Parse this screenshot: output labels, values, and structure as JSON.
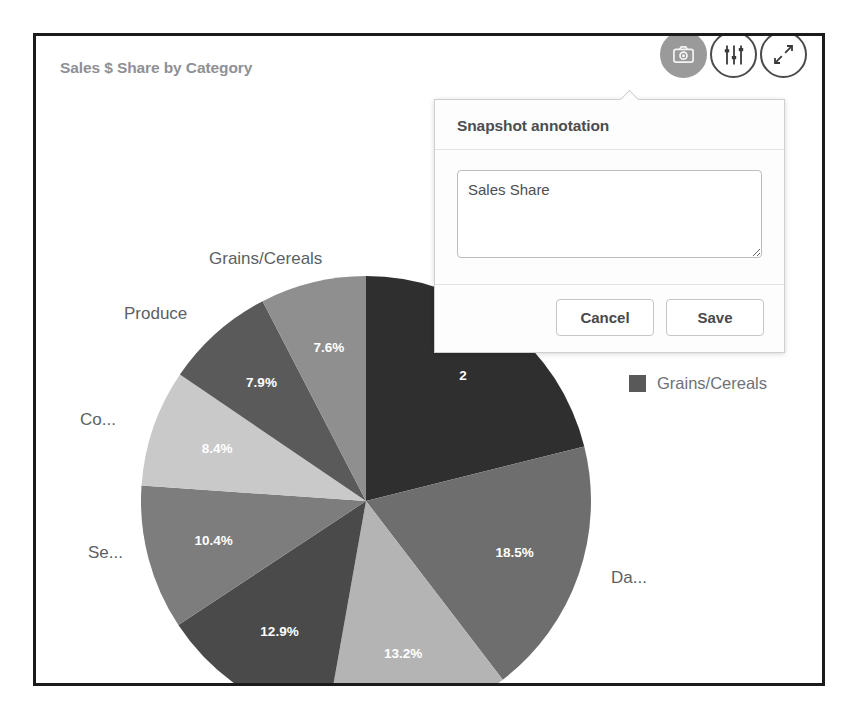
{
  "card": {
    "title": "Sales $ Share by Category"
  },
  "toolbar": {
    "buttons": [
      {
        "name": "snapshot-button",
        "icon": "camera-icon",
        "active": true
      },
      {
        "name": "settings-button",
        "icon": "sliders-icon",
        "active": false
      },
      {
        "name": "fullscreen-button",
        "icon": "expand-arrows-icon",
        "active": false
      }
    ]
  },
  "legend": {
    "items": [
      {
        "label": "Grains/Cereals",
        "color": "#595959"
      }
    ]
  },
  "popover": {
    "title": "Snapshot annotation",
    "textarea_value": "Sales Share",
    "textarea_placeholder": "",
    "cancel_label": "Cancel",
    "save_label": "Save"
  },
  "chart_data": {
    "type": "pie",
    "title": "Sales $ Share by Category",
    "value_format": "percent",
    "start_angle": 0,
    "direction": "clockwise",
    "legend_position": "right",
    "categories": [
      "Beverages",
      "Dairy Products",
      "Confections",
      "Meat/Poultry",
      "Seafood",
      "Condiments",
      "Produce",
      "Grains/Cereals"
    ],
    "values": [
      21.1,
      18.5,
      13.2,
      12.9,
      10.4,
      8.4,
      7.9,
      7.6
    ],
    "labels_visible": [
      "2",
      "18.5%",
      "13.2%",
      "12.9%",
      "10.4%",
      "8.4%",
      "7.9%",
      "7.6%"
    ],
    "colors": [
      "#2f2f2f",
      "#6e6e6e",
      "#b4b4b4",
      "#4a4a4a",
      "#7d7d7d",
      "#c9c9c9",
      "#5a5a5a",
      "#8f8f8f"
    ],
    "outer_labels": [
      {
        "text": "Da...",
        "category": "Dairy Products"
      },
      {
        "text": "Meat/Poultry",
        "category": "Meat/Poultry"
      },
      {
        "text": "Se...",
        "category": "Seafood"
      },
      {
        "text": "Co...",
        "category": "Condiments"
      },
      {
        "text": "Produce",
        "category": "Produce"
      },
      {
        "text": "Grains/Cereals",
        "category": "Grains/Cereals"
      }
    ]
  }
}
